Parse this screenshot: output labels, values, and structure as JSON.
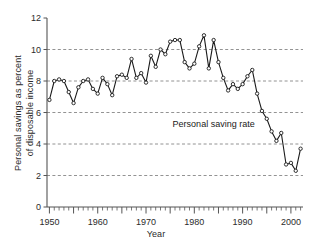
{
  "chart_data": {
    "type": "line",
    "title": "",
    "xlabel": "Year",
    "ylabel": "Personal savings as percent of disposable income",
    "ylabel_lines": [
      "Personal savings as percent",
      "of disposable income"
    ],
    "xlim": [
      1949.5,
      2002.5
    ],
    "ylim": [
      0,
      12
    ],
    "yticks": [
      0,
      2,
      4,
      6,
      8,
      10,
      12
    ],
    "ytick_labels": [
      "0",
      "2",
      "4",
      "6",
      "8",
      "10",
      "12"
    ],
    "xticks": [
      1950,
      1960,
      1970,
      1980,
      1990,
      2000
    ],
    "xtick_labels": [
      "1950",
      "1960",
      "1970",
      "1980",
      "1990",
      "2000"
    ],
    "x_minor_tick_interval": 1,
    "x_major_tick_interval": 5,
    "grid": "horizontal-dashed",
    "gridlines_at": [
      2,
      4,
      6,
      8,
      10
    ],
    "legend": "none",
    "marker": "open-circle",
    "line_color": "#1a1a1a",
    "grid_color": "#777777",
    "annotations": [
      {
        "text": "Personal saving rate",
        "x": 1984.0,
        "y": 5.05
      }
    ],
    "series": [
      {
        "name": "Personal saving rate",
        "x": [
          1950,
          1951,
          1952,
          1953,
          1954,
          1955,
          1956,
          1957,
          1958,
          1959,
          1960,
          1961,
          1962,
          1963,
          1964,
          1965,
          1966,
          1967,
          1968,
          1969,
          1970,
          1971,
          1972,
          1973,
          1974,
          1975,
          1976,
          1977,
          1978,
          1979,
          1980,
          1981,
          1982,
          1983,
          1984,
          1985,
          1986,
          1987,
          1988,
          1989,
          1990,
          1991,
          1992,
          1993,
          1994,
          1995,
          1996,
          1997,
          1998,
          1999,
          2000,
          2001,
          2002
        ],
        "values": [
          6.8,
          8.0,
          8.1,
          8.0,
          7.3,
          6.6,
          7.6,
          8.0,
          8.1,
          7.5,
          7.2,
          8.2,
          7.8,
          7.1,
          8.3,
          8.4,
          8.2,
          9.4,
          8.2,
          8.5,
          7.9,
          9.6,
          8.9,
          10.0,
          9.7,
          10.5,
          10.6,
          10.6,
          9.2,
          8.8,
          9.1,
          10.2,
          10.9,
          8.8,
          10.6,
          9.2,
          8.2,
          7.4,
          7.8,
          7.5,
          7.8,
          8.3,
          8.7,
          7.2,
          6.1,
          5.6,
          4.8,
          4.2,
          4.7,
          2.7,
          2.8,
          2.3,
          3.7
        ]
      }
    ]
  }
}
